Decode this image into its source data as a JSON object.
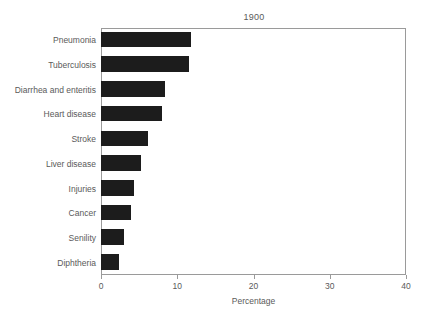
{
  "chart_data": {
    "type": "bar",
    "orientation": "horizontal",
    "title": "1900",
    "xlabel": "Percentage",
    "ylabel": "",
    "xlim": [
      0,
      40
    ],
    "xticks": [
      0,
      10,
      20,
      30,
      40
    ],
    "xtick_labels": [
      "0",
      "10",
      "20",
      "30",
      "40"
    ],
    "grid": false,
    "legend": false,
    "bar_color": "#1c1c1c",
    "frame_color": "#9a9a9a",
    "text_color": "#5a5a5a",
    "categories": [
      "Pneumonia",
      "Tuberculosis",
      "Diarrhea and enteritis",
      "Heart disease",
      "Stroke",
      "Liver disease",
      "Injuries",
      "Cancer",
      "Senility",
      "Diphtheria"
    ],
    "values": [
      11.8,
      11.5,
      8.4,
      8.0,
      6.2,
      5.3,
      4.3,
      3.9,
      3.0,
      2.4
    ]
  }
}
